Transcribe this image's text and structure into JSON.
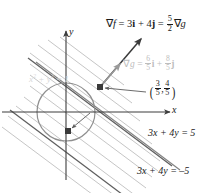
{
  "figure": {
    "type": "lagrange-multiplier-diagram",
    "axes": {
      "x_label": "x",
      "y_label": "y"
    },
    "colors": {
      "axis": "#3d3d3d",
      "dark_line": "#4a4a4a",
      "hatch": "#b9b9b9",
      "circle": "#8a8a8a",
      "gray_text": "#b5b5b5",
      "text": "#1a1a1a",
      "marker": "#3a3a3a"
    },
    "labels": {
      "grad_f": {
        "parts": [
          "∇",
          "f",
          " = 3",
          "i",
          " + 4",
          "j",
          " = ",
          "5",
          "2",
          "∇",
          "g"
        ],
        "text": "∇f = 3i + 4j = 5/2 ∇g",
        "nabla": "∇",
        "f": "f",
        "eq1": " = 3",
        "i": "i",
        "plus": " + 4",
        "j": "j",
        "eq2": " = ",
        "frac_num": "5",
        "frac_den": "2",
        "g": "g"
      },
      "grad_g": {
        "text": "∇g = 6/5 i + 8/5 j",
        "nabla": "∇",
        "g": "g",
        "eq": " = ",
        "frac1_num": "6",
        "frac1_den": "5",
        "i": "i",
        "plus": " + ",
        "frac2_num": "8",
        "frac2_den": "5",
        "j": "j"
      },
      "point": {
        "text": "(3/5, 4/5)",
        "open_paren": "(",
        "close_paren": ")",
        "x_num": "3",
        "x_den": "5",
        "comma": ",",
        "y_num": "4",
        "y_den": "5"
      },
      "constraint_circle": {
        "text": "x² + y² = 1",
        "x": "x",
        "sup2a": "2",
        "plus": " + ",
        "y": "y",
        "sup2b": "2",
        "eq": " = 1"
      },
      "line_upper": {
        "text": "3x + 4y = 5"
      },
      "line_lower": {
        "text": "3x + 4y = –5"
      }
    },
    "geometry": {
      "origin": [
        66,
        112
      ],
      "circle_radius": 29,
      "tangent_point_px": [
        100,
        87
      ],
      "tangent_point_value": [
        0.6,
        0.8
      ],
      "opposite_point_px": [
        68,
        131
      ],
      "opposite_point_value": [
        -0.6,
        -0.8
      ],
      "grad_f_tip_px": [
        143,
        37
      ],
      "grad_g_tip_px": [
        121,
        62
      ],
      "level_line_slope": -0.75,
      "hatch_count": 11
    }
  }
}
